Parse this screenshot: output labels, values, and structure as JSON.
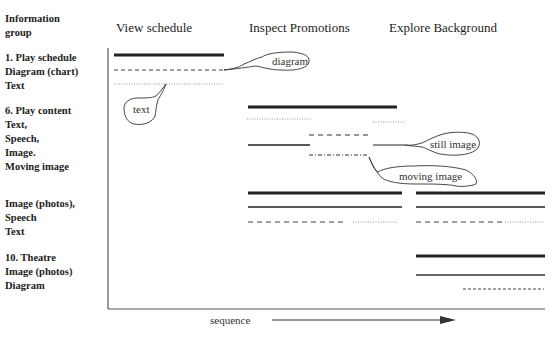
{
  "header": {
    "group_label": "Information\ngroup",
    "group_label_line1": "Information",
    "group_label_line2": "group",
    "columns": [
      "View  schedule",
      "Inspect Promotions",
      "Explore Background"
    ]
  },
  "groups": [
    {
      "title": "1. Play schedule",
      "items": [
        "Diagram (chart)",
        "Text"
      ]
    },
    {
      "title": "6. Play content",
      "items": [
        "Text,",
        "Speech,",
        "Image.",
        "Moving image"
      ]
    },
    {
      "title": "",
      "items": [
        "Image (photos),",
        "Speech",
        "Text"
      ]
    },
    {
      "title": "10. Theatre",
      "items": [
        "Image (photos)",
        "Diagram"
      ]
    }
  ],
  "callouts": {
    "diagram": "diagram",
    "text": "text",
    "still_image": "still image",
    "moving_image": "moving image"
  },
  "axis": {
    "x_label": "sequence"
  },
  "colors": {
    "line": "#222222",
    "dotted": "#999999",
    "axis": "#555555"
  }
}
